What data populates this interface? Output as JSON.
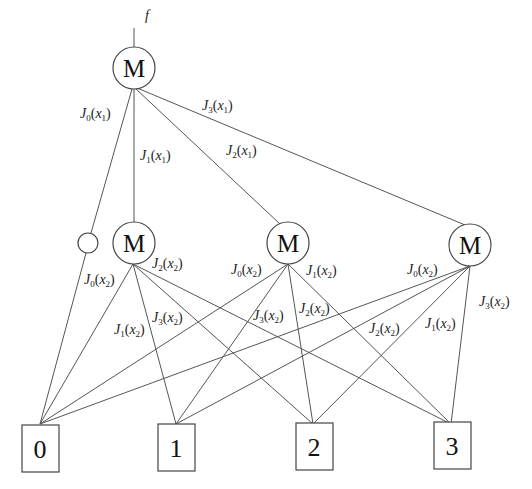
{
  "diagram": {
    "output_label": "f",
    "mux_symbol": "M",
    "top_edges": [
      {
        "fn": "J",
        "idx": "0",
        "var": "x",
        "vidx": "1"
      },
      {
        "fn": "J",
        "idx": "1",
        "var": "x",
        "vidx": "1"
      },
      {
        "fn": "J",
        "idx": "2",
        "var": "x",
        "vidx": "1"
      },
      {
        "fn": "J",
        "idx": "3",
        "var": "x",
        "vidx": "1"
      }
    ],
    "m1_labels": [
      {
        "fn": "J",
        "idx": "0",
        "var": "x",
        "vidx": "2"
      },
      {
        "fn": "J",
        "idx": "1",
        "var": "x",
        "vidx": "2"
      },
      {
        "fn": "J",
        "idx": "2",
        "var": "x",
        "vidx": "2"
      },
      {
        "fn": "J",
        "idx": "3",
        "var": "x",
        "vidx": "2"
      }
    ],
    "m2_labels": [
      {
        "fn": "J",
        "idx": "0",
        "var": "x",
        "vidx": "2"
      },
      {
        "fn": "J",
        "idx": "1",
        "var": "x",
        "vidx": "2"
      },
      {
        "fn": "J",
        "idx": "2",
        "var": "x",
        "vidx": "2"
      },
      {
        "fn": "J",
        "idx": "3",
        "var": "x",
        "vidx": "2"
      }
    ],
    "m3_labels": [
      {
        "fn": "J",
        "idx": "0",
        "var": "x",
        "vidx": "2"
      },
      {
        "fn": "J",
        "idx": "1",
        "var": "x",
        "vidx": "2"
      },
      {
        "fn": "J",
        "idx": "2",
        "var": "x",
        "vidx": "2"
      },
      {
        "fn": "J",
        "idx": "3",
        "var": "x",
        "vidx": "2"
      }
    ],
    "terminals": [
      "0",
      "1",
      "2",
      "3"
    ]
  }
}
